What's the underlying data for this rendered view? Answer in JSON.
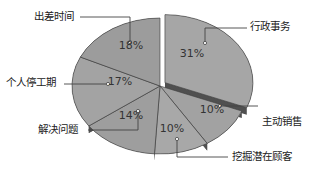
{
  "chart_data": {
    "type": "pie",
    "style": "3d-exploded",
    "title": "",
    "slices": [
      {
        "label": "行政事务",
        "value": 31,
        "display": "31%",
        "exploded": true
      },
      {
        "label": "主动销售",
        "value": 10,
        "display": "10%",
        "exploded": false
      },
      {
        "label": "挖掘潜在顾客",
        "value": 10,
        "display": "10%",
        "exploded": false
      },
      {
        "label": "解决问题",
        "value": 14,
        "display": "14%",
        "exploded": false
      },
      {
        "label": "个人停工期",
        "value": 17,
        "display": "17%",
        "exploded": false
      },
      {
        "label": "出差时间",
        "value": 18,
        "display": "18%",
        "exploded": false
      }
    ],
    "legend": "none (callout labels)"
  },
  "colors": {
    "slice_fill": "#a0a0a0",
    "slice_fill_light": "#b0b0b0",
    "slice_side": "#505050",
    "slice_edge": "#3a3a3a",
    "leader_line": "#444444"
  }
}
